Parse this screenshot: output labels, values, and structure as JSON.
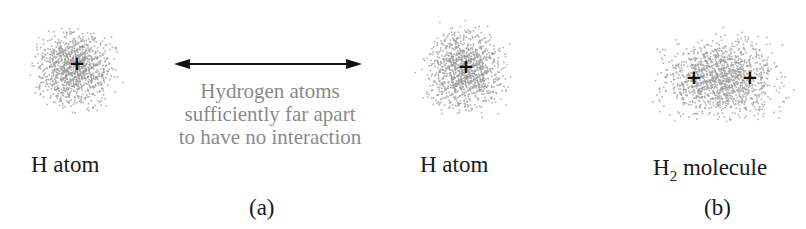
{
  "panel_a": {
    "left_atom_label": "H atom",
    "right_atom_label": "H atom",
    "separation_note": [
      "Hydrogen atoms",
      "sufficiently far apart",
      "to have no interaction"
    ],
    "caption": "(a)"
  },
  "panel_b": {
    "molecule_label_main": "H",
    "molecule_label_sub": "2",
    "molecule_label_rest": " molecule",
    "caption": "(b)"
  },
  "nucleus_symbol": "+",
  "colors": {
    "cloud": "#9a9a9a",
    "text": "#1a1a1a",
    "note": "#8a8a8a"
  }
}
